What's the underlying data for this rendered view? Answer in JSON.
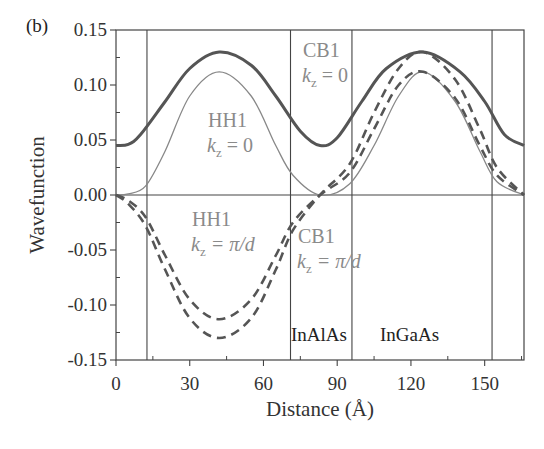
{
  "panel_label": "(b)",
  "chart_data": {
    "type": "line",
    "title": "",
    "xlabel": "Distance (Å)",
    "ylabel": "Wavefunction",
    "xlim": [
      0,
      166
    ],
    "ylim": [
      -0.15,
      0.15
    ],
    "xticks": [
      0,
      30,
      60,
      90,
      120,
      150
    ],
    "xtick_labels": [
      "0",
      "30",
      "60",
      "90",
      "120",
      "150"
    ],
    "yticks": [
      0.15,
      0.1,
      0.05,
      0.0,
      -0.05,
      -0.1,
      -0.15
    ],
    "ytick_labels": [
      "0.15",
      "0.10",
      "0.05",
      "0.00",
      "-0.05",
      "-0.10",
      "-0.15"
    ],
    "grid": false,
    "horizontal_line_at": 0,
    "vertical_boundaries": [
      12.6,
      71,
      96,
      153
    ],
    "region_labels": [
      "InAlAs",
      "InGaAs"
    ],
    "series": [
      {
        "name": "CB1 kz = 0",
        "style": "solid-thick",
        "color": "#555555",
        "x": [
          0,
          5,
          10,
          20,
          30,
          42,
          55,
          65,
          75,
          83,
          90,
          100,
          110,
          125,
          140,
          150,
          158,
          166
        ],
        "values": [
          0.045,
          0.046,
          0.055,
          0.085,
          0.115,
          0.13,
          0.118,
          0.09,
          0.058,
          0.045,
          0.052,
          0.085,
          0.115,
          0.13,
          0.112,
          0.085,
          0.055,
          0.045
        ]
      },
      {
        "name": "HH1 kz = 0",
        "style": "solid-thin",
        "color": "#777777",
        "x": [
          0,
          5,
          12,
          20,
          30,
          42,
          55,
          65,
          72,
          83,
          95,
          105,
          115,
          125,
          138,
          148,
          155,
          166
        ],
        "values": [
          0.0,
          0.001,
          0.008,
          0.04,
          0.09,
          0.112,
          0.09,
          0.045,
          0.018,
          0.0,
          0.01,
          0.045,
          0.09,
          0.112,
          0.085,
          0.04,
          0.012,
          0.0
        ]
      },
      {
        "name": "HH1 kz = π/d",
        "style": "dashed",
        "color": "#555555",
        "x": [
          0,
          5,
          12,
          20,
          30,
          42,
          55,
          65,
          72,
          83,
          95,
          105,
          115,
          125,
          138,
          148,
          155,
          166
        ],
        "values": [
          0.0,
          -0.005,
          -0.02,
          -0.055,
          -0.095,
          -0.113,
          -0.095,
          -0.055,
          -0.025,
          0.0,
          0.02,
          0.06,
          0.1,
          0.112,
          0.088,
          0.045,
          0.018,
          0.0
        ]
      },
      {
        "name": "CB1 kz = π/d",
        "style": "dashed",
        "color": "#555555",
        "x": [
          0,
          5,
          12,
          20,
          30,
          42,
          55,
          65,
          72,
          83,
          95,
          105,
          115,
          125,
          138,
          148,
          155,
          166
        ],
        "values": [
          0.0,
          -0.008,
          -0.028,
          -0.068,
          -0.112,
          -0.13,
          -0.112,
          -0.068,
          -0.032,
          0.0,
          0.028,
          0.075,
          0.115,
          0.13,
          0.105,
          0.06,
          0.025,
          0.0
        ]
      }
    ],
    "annotations": [
      {
        "text_main": "CB1",
        "text_sub": "kz = 0"
      },
      {
        "text_main": "HH1",
        "text_sub": "kz = 0"
      },
      {
        "text_main": "HH1",
        "text_sub": "kz = π/d"
      },
      {
        "text_main": "CB1",
        "text_sub": "kz = π/d"
      }
    ]
  },
  "labels": {
    "cb1_k0_main": "CB1",
    "cb1_k0_k": "k",
    "cb1_k0_sub": "z",
    "cb1_k0_eq": " = 0",
    "hh1_k0_main": "HH1",
    "hh1_k0_k": "k",
    "hh1_k0_sub": "z",
    "hh1_k0_eq": " = 0",
    "hh1_kpi_main": "HH1",
    "hh1_kpi_k": "k",
    "hh1_kpi_sub": "z",
    "hh1_kpi_eq": " = π/d",
    "cb1_kpi_main": "CB1",
    "cb1_kpi_k": "k",
    "cb1_kpi_sub": "z",
    "cb1_kpi_eq": " = π/d",
    "region_inalas": "InAlAs",
    "region_ingaas": "InGaAs",
    "xlabel": "Distance (Å)",
    "ylabel": "Wavefunction"
  }
}
